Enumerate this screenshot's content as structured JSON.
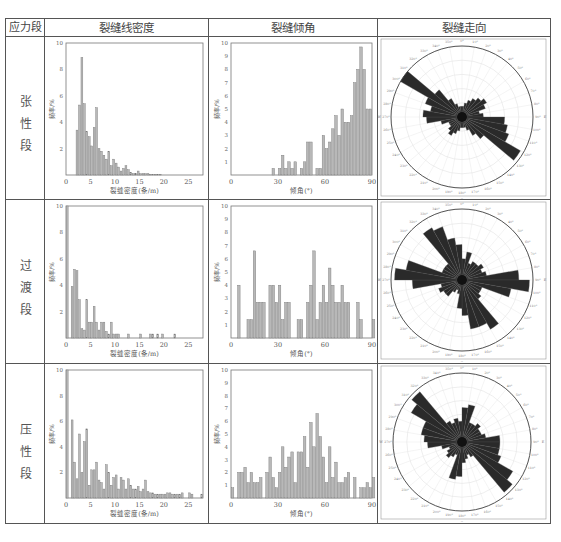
{
  "table": {
    "headers": [
      "应力段",
      "裂缝线密度",
      "裂缝倾角",
      "裂缝走向"
    ],
    "rows": [
      {
        "label": "张性段",
        "chars": [
          "张",
          "性",
          "段"
        ]
      },
      {
        "label": "过渡段",
        "chars": [
          "过",
          "渡",
          "段"
        ]
      },
      {
        "label": "压性段",
        "chars": [
          "压",
          "性",
          "段"
        ]
      }
    ]
  },
  "axes": {
    "density_xlabel": "裂缝密度(条/m)",
    "dip_xlabel": "倾角(°)",
    "ylabel": "频率/%",
    "density_xticks": [
      "0",
      "5",
      "10",
      "15",
      "20",
      "25"
    ],
    "dip_xticks": [
      "0",
      "30",
      "60",
      "90"
    ],
    "density_yticks": [
      "2",
      "4",
      "6",
      "8",
      "10"
    ],
    "dip_yticks": [
      "1",
      "2",
      "3",
      "4",
      "5",
      "6",
      "7",
      "8",
      "9",
      "10"
    ]
  },
  "chart_data": [
    {
      "id": "density-tension",
      "type": "bar",
      "title": "裂缝线密度 - 张性段",
      "xlabel": "裂缝密度(条/m)",
      "ylabel": "频率/%",
      "xlim": [
        0,
        28
      ],
      "ylim": [
        0,
        10
      ],
      "bin_width": 0.5,
      "x": [
        2,
        2.5,
        3,
        3.5,
        4,
        4.5,
        5,
        5.5,
        6,
        6.5,
        7,
        7.5,
        8,
        8.5,
        9,
        9.5,
        10,
        10.5,
        11,
        11.5,
        12,
        12.5,
        13,
        13.5,
        14,
        14.5,
        15,
        15.5,
        16,
        16.5,
        17,
        17.5,
        18,
        18.5,
        19
      ],
      "values": [
        3.4,
        5.3,
        8.9,
        5.4,
        3.3,
        2.9,
        2.2,
        3.6,
        5.1,
        2.0,
        1.8,
        1.5,
        1.2,
        1.8,
        0.7,
        1.2,
        0.9,
        0.6,
        0.3,
        0.5,
        0.7,
        0.4,
        0.2,
        0.1,
        0.1,
        0.3,
        0.1,
        0.1,
        0.1,
        0.1,
        0.05,
        0.05,
        0.05,
        0.05,
        0.05
      ]
    },
    {
      "id": "dip-tension",
      "type": "bar",
      "title": "裂缝倾角 - 张性段",
      "xlabel": "倾角(°)",
      "ylabel": "频率/%",
      "xlim": [
        0,
        90
      ],
      "ylim": [
        0,
        10
      ],
      "bin_width": 2,
      "x": [
        26,
        30,
        32,
        34,
        36,
        38,
        40,
        44,
        46,
        48,
        50,
        54,
        56,
        58,
        60,
        62,
        64,
        66,
        68,
        70,
        72,
        74,
        76,
        78,
        80,
        82,
        84,
        86,
        88
      ],
      "values": [
        0.5,
        0.5,
        1.5,
        0.5,
        1.0,
        0.5,
        1.0,
        0.5,
        1.0,
        2.5,
        2.5,
        0.5,
        0.5,
        3.0,
        2.0,
        2.5,
        3.5,
        4.5,
        3.0,
        5.0,
        4.0,
        4.0,
        4.5,
        7.0,
        8.0,
        9.7,
        8.0,
        5.0,
        5.0
      ]
    },
    {
      "id": "density-transition",
      "type": "bar",
      "title": "裂缝线密度 - 过渡段",
      "xlabel": "裂缝密度(条/m)",
      "ylabel": "频率/%",
      "xlim": [
        0,
        28
      ],
      "ylim": [
        0,
        10
      ],
      "bin_width": 0.5,
      "x": [
        0,
        1,
        1.5,
        2,
        2.5,
        3,
        3.5,
        4,
        4.5,
        5,
        5.5,
        6,
        6.5,
        7,
        7.5,
        8,
        8.5,
        9,
        9.5,
        10,
        10.5,
        12.5,
        15,
        17,
        17.5,
        18.5,
        19.5,
        22
      ],
      "values": [
        10,
        3.9,
        5.2,
        5.1,
        2.9,
        0.7,
        0.6,
        2.9,
        1.2,
        1.2,
        2.4,
        1.2,
        0.6,
        1.2,
        1.2,
        0.5,
        0.3,
        1.2,
        0.3,
        0.3,
        0.3,
        0.3,
        0.3,
        0.3,
        0.3,
        0.3,
        0.3,
        0.3
      ]
    },
    {
      "id": "dip-transition",
      "type": "bar",
      "title": "裂缝倾角 - 过渡段",
      "xlabel": "倾角(°)",
      "ylabel": "频率/%",
      "xlim": [
        0,
        90
      ],
      "ylim": [
        0,
        10
      ],
      "bin_width": 2,
      "x": [
        4,
        10,
        12,
        14,
        16,
        18,
        20,
        24,
        26,
        28,
        30,
        32,
        34,
        36,
        42,
        44,
        48,
        50,
        52,
        54,
        56,
        58,
        60,
        62,
        64,
        66,
        68,
        70,
        72,
        74,
        80,
        82,
        90
      ],
      "values": [
        4.0,
        1.4,
        1.4,
        6.6,
        2.7,
        2.7,
        2.7,
        4.0,
        4.0,
        2.7,
        4.0,
        1.4,
        2.7,
        2.7,
        1.4,
        1.4,
        2.7,
        4.0,
        6.6,
        1.4,
        2.7,
        4.0,
        2.7,
        5.3,
        4.0,
        2.7,
        2.7,
        4.0,
        2.7,
        2.7,
        2.7,
        1.4,
        1.4
      ]
    },
    {
      "id": "density-compression",
      "type": "bar",
      "title": "裂缝线密度 - 压性段",
      "xlabel": "裂缝密度(条/m)",
      "ylabel": "频率/%",
      "xlim": [
        0,
        28
      ],
      "ylim": [
        0,
        10
      ],
      "bin_width": 0.5,
      "x": [
        0,
        1,
        1.5,
        2,
        2.5,
        3,
        3.5,
        4,
        4.5,
        5,
        5.5,
        6,
        6.5,
        7,
        7.5,
        8,
        8.5,
        9,
        9.5,
        10,
        10.5,
        11,
        11.5,
        12,
        12.5,
        13,
        13.5,
        14,
        14.5,
        15,
        15.5,
        16,
        16.5,
        17,
        17.5,
        18,
        18.5,
        19,
        19.5,
        20,
        20.5,
        21,
        21.5,
        22,
        22.5,
        23,
        23.5,
        25,
        25.5,
        27.5
      ],
      "values": [
        10,
        6.1,
        2.8,
        1.5,
        5.0,
        2.0,
        4.4,
        5.4,
        1.0,
        2.2,
        2.2,
        2.8,
        1.4,
        1.2,
        0.7,
        2.6,
        2.0,
        1.0,
        1.6,
        1.8,
        0.7,
        1.6,
        1.4,
        0.7,
        1.5,
        1.0,
        0.7,
        0.7,
        0.9,
        0.5,
        0.7,
        1.4,
        0.5,
        0.4,
        0.4,
        0.3,
        0.3,
        0.3,
        0.3,
        0.3,
        0.4,
        0.4,
        0.3,
        0.3,
        0.3,
        0.3,
        0.4,
        0.4,
        0.3,
        0.3
      ]
    },
    {
      "id": "dip-compression",
      "type": "bar",
      "title": "裂缝倾角 - 压性段",
      "xlabel": "倾角(°)",
      "ylabel": "频率/%",
      "xlim": [
        0,
        90
      ],
      "ylim": [
        0,
        10
      ],
      "bin_width": 2,
      "x": [
        0,
        4,
        6,
        8,
        10,
        12,
        14,
        16,
        18,
        22,
        24,
        26,
        28,
        30,
        32,
        34,
        36,
        38,
        40,
        42,
        44,
        46,
        48,
        50,
        52,
        54,
        56,
        58,
        60,
        62,
        64,
        66,
        68,
        70,
        72,
        74,
        78,
        82,
        84,
        86,
        88,
        90
      ],
      "values": [
        0.8,
        2.0,
        2.0,
        2.4,
        1.2,
        2.0,
        1.2,
        1.2,
        1.6,
        2.0,
        3.2,
        1.6,
        0.8,
        2.0,
        4.0,
        2.4,
        3.2,
        3.6,
        1.2,
        3.6,
        3.6,
        4.8,
        2.4,
        5.9,
        4.0,
        6.6,
        4.8,
        3.2,
        1.2,
        4.0,
        1.6,
        2.8,
        1.2,
        1.2,
        1.6,
        2.0,
        1.6,
        0.8,
        0.8,
        1.2,
        0.8,
        1.6
      ]
    },
    {
      "id": "rose-tension",
      "type": "rose",
      "title": "裂缝走向 - 张性段",
      "bin_deg": 10,
      "dominant_trend": "NW-SE (~300°/120°)",
      "directions": [
        0,
        10,
        20,
        30,
        40,
        50,
        60,
        70,
        80,
        90,
        100,
        110,
        120,
        130,
        140,
        150,
        160,
        170,
        180,
        190,
        200,
        210,
        220,
        230,
        240,
        250,
        260,
        270,
        280,
        290,
        300,
        310,
        320,
        330,
        340,
        350
      ],
      "values": [
        0.15,
        0.2,
        0.25,
        0.3,
        0.35,
        0.4,
        0.35,
        0.25,
        0.3,
        0.6,
        0.65,
        0.7,
        0.95,
        0.4,
        0.3,
        0.2,
        0.15,
        0.15,
        0.15,
        0.2,
        0.25,
        0.3,
        0.25,
        0.2,
        0.2,
        0.3,
        0.5,
        0.55,
        0.45,
        0.55,
        1.0,
        0.5,
        0.3,
        0.2,
        0.15,
        0.15
      ]
    },
    {
      "id": "rose-transition",
      "type": "rose",
      "title": "裂缝走向 - 过渡段",
      "bin_deg": 10,
      "dominant_trend": "E-W and NNW-SSE",
      "directions": [
        0,
        10,
        20,
        30,
        40,
        50,
        60,
        70,
        80,
        90,
        100,
        110,
        120,
        130,
        140,
        150,
        160,
        170,
        180,
        190,
        200,
        210,
        220,
        230,
        240,
        250,
        260,
        270,
        280,
        290,
        300,
        310,
        320,
        330,
        340,
        350
      ],
      "values": [
        0.3,
        0.4,
        0.25,
        0.3,
        0.3,
        0.35,
        0.3,
        0.35,
        0.8,
        0.95,
        0.7,
        0.3,
        0.3,
        0.35,
        0.8,
        0.7,
        0.7,
        0.5,
        0.4,
        0.2,
        0.15,
        0.2,
        0.3,
        0.3,
        0.35,
        0.3,
        0.7,
        0.95,
        0.8,
        0.3,
        0.3,
        0.3,
        0.85,
        0.8,
        0.6,
        0.5
      ]
    },
    {
      "id": "rose-compression",
      "type": "rose",
      "title": "裂缝走向 - 压性段",
      "bin_deg": 10,
      "dominant_trend": "NW-SE (~310°/130°)",
      "directions": [
        0,
        10,
        20,
        30,
        40,
        50,
        60,
        70,
        80,
        90,
        100,
        110,
        120,
        130,
        140,
        150,
        160,
        170,
        180,
        190,
        200,
        210,
        220,
        230,
        240,
        250,
        260,
        270,
        280,
        290,
        300,
        310,
        320,
        330,
        340,
        350
      ],
      "values": [
        0.5,
        0.55,
        0.3,
        0.3,
        0.35,
        0.3,
        0.3,
        0.35,
        0.55,
        0.55,
        0.55,
        0.6,
        0.85,
        0.95,
        0.25,
        0.2,
        0.25,
        0.3,
        0.5,
        0.55,
        0.2,
        0.25,
        0.3,
        0.25,
        0.2,
        0.3,
        0.5,
        0.55,
        0.6,
        0.6,
        0.85,
        0.95,
        0.35,
        0.3,
        0.35,
        0.3
      ]
    }
  ]
}
